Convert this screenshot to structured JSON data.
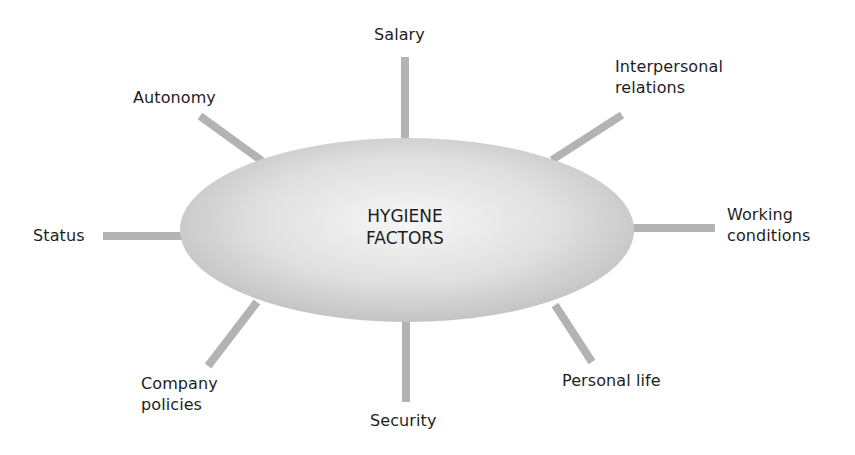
{
  "diagram": {
    "center": {
      "label": "HYGIENE\nFACTORS",
      "fill_center": "#f4f4f4",
      "fill_edge": "#c6c6c6"
    },
    "spoke_color": "#b3b3b3",
    "factors": [
      {
        "id": "salary",
        "label": "Salary"
      },
      {
        "id": "interpersonal-relations",
        "label": "Interpersonal\nrelations"
      },
      {
        "id": "working-conditions",
        "label": "Working\nconditions"
      },
      {
        "id": "personal-life",
        "label": "Personal life"
      },
      {
        "id": "security",
        "label": "Security"
      },
      {
        "id": "company-policies",
        "label": "Company\npolicies"
      },
      {
        "id": "status",
        "label": "Status"
      },
      {
        "id": "autonomy",
        "label": "Autonomy"
      }
    ]
  }
}
